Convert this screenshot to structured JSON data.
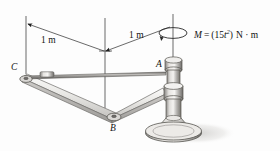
{
  "figure": {
    "type": "engineering-mechanics-diagram",
    "background_color": "#fdfdfd",
    "ink_color": "#1a1a1a",
    "metal_light": "#f0efed",
    "metal_mid": "#b9b7b4",
    "metal_dark": "#7e7c79",
    "shadow_color": "#d8d7d5"
  },
  "dimensions": [
    {
      "id": "dim-left",
      "label": "1 m",
      "from": "C",
      "to": "B-axis"
    },
    {
      "id": "dim-right",
      "label": "1 m",
      "from": "B-axis",
      "to": "A-axis"
    }
  ],
  "points": [
    {
      "id": "point-c",
      "label": "C"
    },
    {
      "id": "point-a",
      "label": "A"
    },
    {
      "id": "point-b",
      "label": "B"
    }
  ],
  "moment": {
    "symbol": "M",
    "equals": "=",
    "open_paren": "(",
    "coefficient": "15",
    "variable": "t",
    "exponent": "2",
    "close_paren": ")",
    "units": "N · m",
    "full_text": "M = (15t²) N · m",
    "sense": "counterclockwise-about-vertical-axis"
  }
}
